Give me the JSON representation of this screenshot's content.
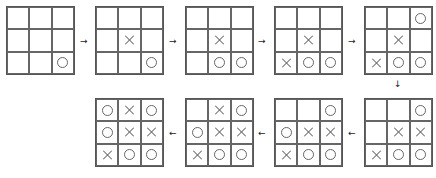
{
  "diagram": {
    "title": "",
    "boards": [
      {
        "id": 1,
        "row": "top",
        "x": 6,
        "y": 6,
        "cells": [
          "",
          "",
          "",
          "",
          "",
          "",
          "",
          "",
          "O"
        ]
      },
      {
        "id": 2,
        "row": "top",
        "x": 95,
        "y": 6,
        "cells": [
          "",
          "",
          "",
          "",
          "X",
          "",
          "",
          "",
          "O"
        ]
      },
      {
        "id": 3,
        "row": "top",
        "x": 185,
        "y": 6,
        "cells": [
          "",
          "",
          "",
          "",
          "X",
          "",
          "",
          "O",
          "O"
        ]
      },
      {
        "id": 4,
        "row": "top",
        "x": 274,
        "y": 6,
        "cells": [
          "",
          "",
          "",
          "",
          "X",
          "",
          "X",
          "O",
          "O"
        ]
      },
      {
        "id": 5,
        "row": "top",
        "x": 364,
        "y": 6,
        "cells": [
          "",
          "",
          "O",
          "",
          "X",
          "",
          "X",
          "O",
          "O"
        ]
      },
      {
        "id": 6,
        "row": "bottom",
        "x": 364,
        "y": 98,
        "cells": [
          "",
          "",
          "O",
          "",
          "X",
          "X",
          "X",
          "O",
          "O"
        ]
      },
      {
        "id": 7,
        "row": "bottom",
        "x": 274,
        "y": 98,
        "cells": [
          "",
          "",
          "O",
          "O",
          "X",
          "X",
          "X",
          "O",
          "O"
        ]
      },
      {
        "id": 8,
        "row": "bottom",
        "x": 185,
        "y": 98,
        "cells": [
          "",
          "X",
          "O",
          "O",
          "X",
          "X",
          "X",
          "O",
          "O"
        ]
      },
      {
        "id": 9,
        "row": "bottom",
        "x": 95,
        "y": 98,
        "cells": [
          "O",
          "X",
          "O",
          "O",
          "X",
          "X",
          "X",
          "O",
          "O"
        ]
      }
    ],
    "arrows": [
      {
        "direction": "right",
        "glyph": "→",
        "x": 80,
        "y": 37
      },
      {
        "direction": "right",
        "glyph": "→",
        "x": 169,
        "y": 37
      },
      {
        "direction": "right",
        "glyph": "→",
        "x": 258,
        "y": 37
      },
      {
        "direction": "right",
        "glyph": "→",
        "x": 348,
        "y": 37
      },
      {
        "direction": "down",
        "glyph": "↓",
        "x": 394,
        "y": 80
      },
      {
        "direction": "left",
        "glyph": "←",
        "x": 348,
        "y": 129
      },
      {
        "direction": "left",
        "glyph": "←",
        "x": 258,
        "y": 129
      },
      {
        "direction": "left",
        "glyph": "←",
        "x": 169,
        "y": 129
      }
    ],
    "colors": {
      "line": "#666666",
      "arrow": "#222222",
      "background": "#ffffff"
    }
  }
}
